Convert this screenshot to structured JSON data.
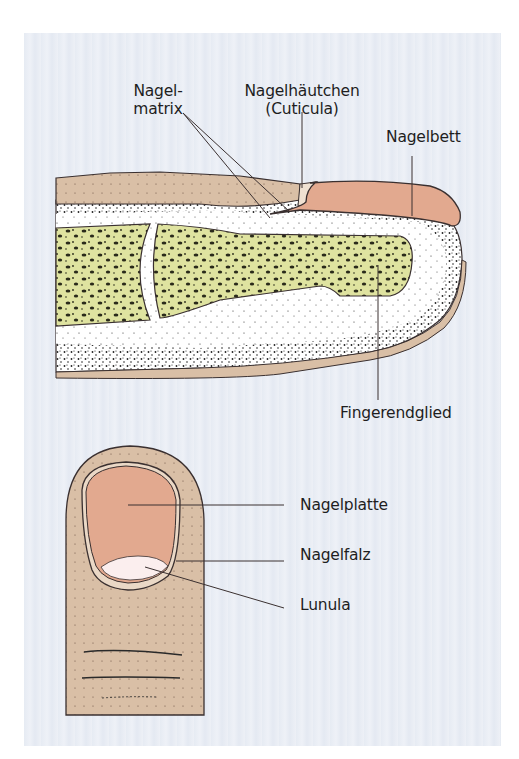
{
  "figure": {
    "views": [
      {
        "name": "longitudinal-section",
        "description": "Längsschnitt durch das Fingerendglied"
      },
      {
        "name": "dorsal-view",
        "description": "Aufsicht auf den Fingernagel"
      }
    ]
  },
  "labels": {
    "nagelmatrix_line1": "Nagel-",
    "nagelmatrix_line2": "matrix",
    "cuticula_line1": "Nagelhäutchen",
    "cuticula_line2": "(Cuticula)",
    "nagelbett": "Nagelbett",
    "fingerendglied": "Fingerendglied",
    "nagelplatte": "Nagelplatte",
    "nagelfalz": "Nagelfalz",
    "lunula": "Lunula"
  },
  "colors": {
    "background": "#e9edf4",
    "skin": "#d9bfa6",
    "nail": "#e2a98f",
    "bone": "#dfe3a0",
    "lunula": "#fbeeee",
    "outline": "#3a3030",
    "soft_tissue": "#ffffff"
  }
}
